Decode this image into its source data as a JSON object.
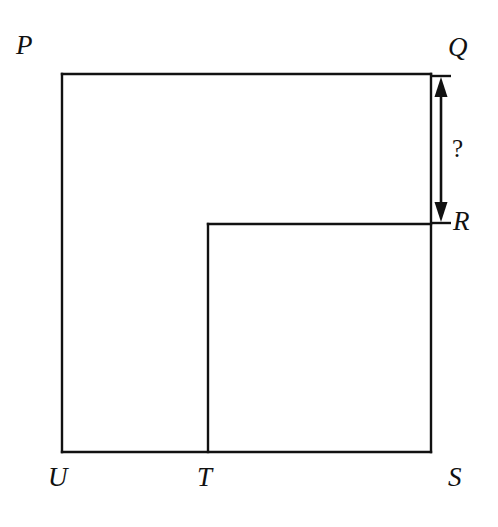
{
  "figure": {
    "background_color": "#ffffff",
    "stroke_color": "#111111",
    "stroke_width": 2,
    "canvas": {
      "width": 498,
      "height": 527
    },
    "vertices": [
      {
        "id": "P",
        "label": "P",
        "x": 62,
        "y": 74
      },
      {
        "id": "Q",
        "label": "Q",
        "x": 431,
        "y": 74
      },
      {
        "id": "R",
        "label": "R",
        "x": 431,
        "y": 224
      },
      {
        "id": "T2",
        "label": "",
        "x": 208,
        "y": 224
      },
      {
        "id": "T",
        "label": "T",
        "x": 208,
        "y": 452
      },
      {
        "id": "S",
        "label": "S",
        "x": 431,
        "y": 452
      },
      {
        "id": "U",
        "label": "U",
        "x": 62,
        "y": 452
      }
    ],
    "outline_path": "M 62 74 L 431 74 L 431 224 L 208 224 L 208 452 L 431 452 L 431 74",
    "segments": [
      {
        "name": "PQ",
        "from": "P",
        "to": "Q",
        "x1": 62,
        "y1": 74,
        "x2": 431,
        "y2": 74
      },
      {
        "name": "QS-right-edge",
        "from": "Q",
        "to": "S",
        "x1": 431,
        "y1": 74,
        "x2": 431,
        "y2": 452
      },
      {
        "name": "RT-inner-horizontal",
        "from": "R",
        "to": "T2",
        "x1": 431,
        "y1": 224,
        "x2": 208,
        "y2": 224
      },
      {
        "name": "T2T-inner-vertical",
        "from": "T2",
        "to": "T",
        "x1": 208,
        "y1": 224,
        "x2": 208,
        "y2": 452
      },
      {
        "name": "US-bottom-edge",
        "from": "U",
        "to": "S",
        "x1": 62,
        "y1": 452,
        "x2": 431,
        "y2": 452
      },
      {
        "name": "PU-left-edge",
        "from": "P",
        "to": "U",
        "x1": 62,
        "y1": 74,
        "x2": 62,
        "y2": 452
      }
    ],
    "dimension": {
      "name": "QR",
      "label": "?",
      "from_vertex": "Q",
      "to_vertex": "R",
      "axis": "vertical",
      "line_x": 441,
      "y_top": 76,
      "y_bottom": 223,
      "arrowheads": "both",
      "extension_tick_half_width": 10,
      "label_x": 452,
      "label_y": 136
    },
    "labels": {
      "P": "P",
      "Q": "Q",
      "R": "R",
      "S": "S",
      "T": "T",
      "U": "U",
      "question": "?"
    }
  }
}
